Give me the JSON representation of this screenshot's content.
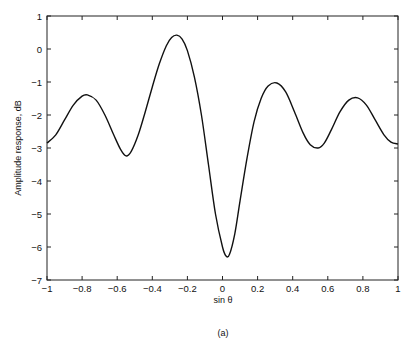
{
  "chart_data": {
    "type": "line",
    "title": "",
    "xlabel": "sin θ",
    "ylabel": "Amplitude response, dB",
    "caption": "(a)",
    "xlim": [
      -1,
      1
    ],
    "ylim": [
      -7,
      1
    ],
    "grid": false,
    "legend": null,
    "x_ticks": [
      -1,
      -0.8,
      -0.6,
      -0.4,
      -0.2,
      0,
      0.2,
      0.4,
      0.6,
      0.8,
      1
    ],
    "x_tick_labels": [
      "-1",
      "-0.8",
      "-0.6",
      "-0.4",
      "-0.2",
      "0",
      "0.2",
      "0.4",
      "0.6",
      "0.8",
      "1"
    ],
    "y_ticks": [
      1,
      0,
      -1,
      -2,
      -3,
      -4,
      -5,
      -6,
      -7
    ],
    "y_tick_labels": [
      "1",
      "0",
      "-1",
      "-2",
      "-3",
      "-4",
      "-5",
      "-6",
      "-7"
    ],
    "series": [
      {
        "name": "amplitude response",
        "color": "#111111",
        "x": [
          -1.0,
          -0.95,
          -0.9,
          -0.85,
          -0.8,
          -0.77,
          -0.72,
          -0.67,
          -0.62,
          -0.58,
          -0.55,
          -0.52,
          -0.48,
          -0.44,
          -0.4,
          -0.36,
          -0.32,
          -0.29,
          -0.26,
          -0.23,
          -0.2,
          -0.16,
          -0.12,
          -0.08,
          -0.04,
          0.0,
          0.02,
          0.04,
          0.07,
          0.1,
          0.14,
          0.18,
          0.22,
          0.26,
          0.31,
          0.36,
          0.41,
          0.46,
          0.5,
          0.545,
          0.58,
          0.62,
          0.67,
          0.72,
          0.77,
          0.82,
          0.87,
          0.92,
          0.96,
          1.0
        ],
        "values": [
          -2.85,
          -2.6,
          -2.15,
          -1.7,
          -1.43,
          -1.39,
          -1.55,
          -2.0,
          -2.6,
          -3.05,
          -3.24,
          -3.1,
          -2.6,
          -1.9,
          -1.15,
          -0.45,
          0.1,
          0.35,
          0.42,
          0.3,
          -0.05,
          -0.85,
          -2.0,
          -3.5,
          -5.0,
          -6.0,
          -6.27,
          -6.22,
          -5.6,
          -4.6,
          -3.3,
          -2.2,
          -1.5,
          -1.12,
          -1.03,
          -1.3,
          -1.9,
          -2.55,
          -2.9,
          -3.0,
          -2.85,
          -2.45,
          -1.9,
          -1.55,
          -1.48,
          -1.7,
          -2.15,
          -2.6,
          -2.82,
          -2.88
        ]
      }
    ]
  }
}
